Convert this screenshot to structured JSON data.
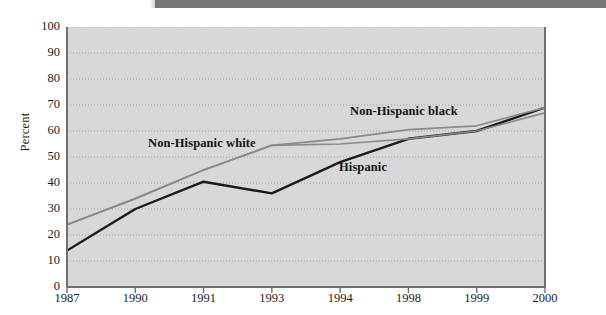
{
  "figure": {
    "ylabel": "Percent",
    "series_labels": {
      "white": "Non-Hispanic white",
      "black": "Non-Hispanic black",
      "hispanic": "Hispanic"
    }
  },
  "chart_data": {
    "type": "line",
    "title": "",
    "xlabel": "",
    "ylabel": "Percent",
    "ylim": [
      0,
      100
    ],
    "yticks": [
      0,
      10,
      20,
      30,
      40,
      50,
      60,
      70,
      80,
      90,
      100
    ],
    "categories": [
      "1987",
      "1990",
      "1991",
      "1993",
      "1994",
      "1998",
      "1999",
      "2000"
    ],
    "grid": "horizontal-dotted",
    "legend": "inline-annotations",
    "colors": {
      "hispanic": "#1a1a1a",
      "non_hispanic_white": "#8a8a8a",
      "non_hispanic_black": "#8a8a8a",
      "plot_background": "#d8d8d8",
      "axis": "#6f6f6f"
    },
    "series": [
      {
        "name": "Hispanic",
        "color": "#1a1a1a",
        "values": [
          14,
          30,
          40.5,
          36,
          48,
          57,
          60,
          69
        ]
      },
      {
        "name": "Non-Hispanic white",
        "color": "#8a8a8a",
        "values": [
          24,
          34,
          45,
          54.5,
          55,
          57,
          60,
          67
        ]
      },
      {
        "name": "Non-Hispanic black",
        "color": "#8a8a8a",
        "values": [
          24,
          34,
          45,
          54.5,
          57,
          60.5,
          62,
          69
        ]
      }
    ]
  }
}
